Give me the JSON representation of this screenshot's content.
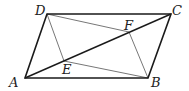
{
  "diagram": {
    "type": "geometry",
    "figure": "parallelogram ABCD with diagonal AC and points E, F on AC",
    "points": {
      "A": {
        "label": "A",
        "x": 25,
        "y": 78
      },
      "B": {
        "label": "B",
        "x": 148,
        "y": 78
      },
      "C": {
        "label": "C",
        "x": 171,
        "y": 14
      },
      "D": {
        "label": "D",
        "x": 47,
        "y": 14
      },
      "E": {
        "label": "E",
        "x": 64,
        "y": 61
      },
      "F": {
        "label": "F",
        "x": 129,
        "y": 32
      }
    },
    "segments": [
      {
        "from": "A",
        "to": "B",
        "style": "thick"
      },
      {
        "from": "B",
        "to": "C",
        "style": "thick"
      },
      {
        "from": "C",
        "to": "D",
        "style": "thick"
      },
      {
        "from": "D",
        "to": "A",
        "style": "thick"
      },
      {
        "from": "A",
        "to": "C",
        "style": "thick"
      },
      {
        "from": "D",
        "to": "E",
        "style": "thin"
      },
      {
        "from": "E",
        "to": "B",
        "style": "thin"
      },
      {
        "from": "D",
        "to": "F",
        "style": "thin"
      },
      {
        "from": "F",
        "to": "B",
        "style": "thin"
      }
    ],
    "colors": {
      "thick": "#1a1a1a",
      "thin": "#777777"
    }
  }
}
